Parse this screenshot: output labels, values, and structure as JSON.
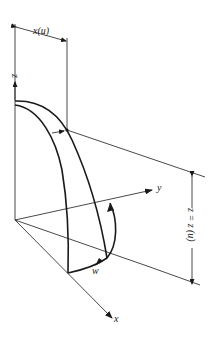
{
  "diagram": {
    "labels": {
      "x_of_u": "x(u)",
      "z_axis": "z",
      "y_axis": "y",
      "x_axis": "x",
      "w": "w",
      "z_eq": "z = z (u)"
    }
  }
}
